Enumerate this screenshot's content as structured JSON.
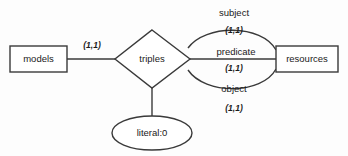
{
  "diagram": {
    "type": "entity-relationship-diagram",
    "background_color": "#fdfdfd",
    "stroke_color": "#3a3a3a",
    "text_color": "#1a1a1a",
    "entities": [
      {
        "id": "models",
        "label": "models",
        "shape": "rectangle"
      },
      {
        "id": "resources",
        "label": "resources",
        "shape": "rectangle"
      }
    ],
    "relationships": [
      {
        "id": "triples",
        "label": "triples",
        "shape": "diamond"
      }
    ],
    "attributes": [
      {
        "id": "literal",
        "label": "literal:0",
        "shape": "ellipse"
      }
    ],
    "edges": [
      {
        "id": "models-triples",
        "from": "models",
        "to": "triples",
        "label": "",
        "cardinality": "(1,1)",
        "style": "straight"
      },
      {
        "id": "triples-subject-resources",
        "from": "triples",
        "to": "resources",
        "label": "subject",
        "cardinality": "(1,1)",
        "style": "arc-up"
      },
      {
        "id": "triples-predicate-resources",
        "from": "triples",
        "to": "resources",
        "label": "predicate",
        "cardinality": "(1,1)",
        "style": "straight"
      },
      {
        "id": "triples-object-resources",
        "from": "triples",
        "to": "resources",
        "label": "object",
        "cardinality": "(1,1)",
        "style": "arc-down"
      },
      {
        "id": "triples-literal",
        "from": "triples",
        "to": "literal",
        "label": "",
        "cardinality": "",
        "style": "straight"
      }
    ]
  }
}
